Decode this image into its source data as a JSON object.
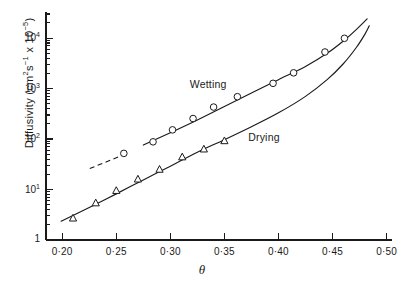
{
  "chart_data": {
    "type": "line",
    "title": "",
    "xlabel": "θ",
    "ylabel_html": "Diffusivity (cm<sup>2</sup>s<sup>−1</sup> x 10<sup>−5</sup>)",
    "ylabel_plain": "Diffusivity (cm2s-1 x 10-5)",
    "xlim": [
      0.185,
      0.505
    ],
    "ylim": [
      1,
      30000
    ],
    "yscale": "log",
    "xscale": "linear",
    "grid": false,
    "legend": "inline-annotations",
    "xticks": [
      0.2,
      0.25,
      0.3,
      0.35,
      0.4,
      0.45,
      0.5
    ],
    "xticklabels": [
      "0·20",
      "0·25",
      "0·30",
      "0·35",
      "0·40",
      "0·45",
      "0·50"
    ],
    "yticks": [
      1,
      10,
      100,
      1000,
      10000
    ],
    "yticklabels": [
      "1",
      "10",
      "10",
      "10",
      "10"
    ],
    "yticklabels_exp": [
      "",
      "1",
      "2",
      "3",
      "4"
    ],
    "series": [
      {
        "name": "Wetting",
        "marker": "open-circle",
        "line": "solid-with-dashed-extension",
        "label_x": 0.318,
        "label_y": 1150,
        "points": [
          {
            "x": 0.257,
            "y": 52
          },
          {
            "x": 0.284,
            "y": 88
          },
          {
            "x": 0.302,
            "y": 152
          },
          {
            "x": 0.321,
            "y": 255
          },
          {
            "x": 0.34,
            "y": 430
          },
          {
            "x": 0.362,
            "y": 690
          },
          {
            "x": 0.395,
            "y": 1270
          },
          {
            "x": 0.414,
            "y": 2050
          },
          {
            "x": 0.443,
            "y": 5300
          },
          {
            "x": 0.461,
            "y": 9900
          }
        ],
        "fit_curve": [
          {
            "x": 0.2255,
            "y": 26
          },
          {
            "x": 0.25,
            "y": 44
          },
          {
            "x": 0.275,
            "y": 76
          },
          {
            "x": 0.3,
            "y": 133
          },
          {
            "x": 0.325,
            "y": 238
          },
          {
            "x": 0.35,
            "y": 440
          },
          {
            "x": 0.375,
            "y": 820
          },
          {
            "x": 0.4,
            "y": 1500
          },
          {
            "x": 0.425,
            "y": 2750
          },
          {
            "x": 0.445,
            "y": 5000
          },
          {
            "x": 0.462,
            "y": 9500
          },
          {
            "x": 0.475,
            "y": 17000
          },
          {
            "x": 0.482,
            "y": 24000
          }
        ],
        "dashed_segment": [
          {
            "x": 0.2255,
            "y": 26
          },
          {
            "x": 0.258,
            "y": 50
          }
        ]
      },
      {
        "name": "Drying",
        "marker": "open-triangle",
        "line": "solid",
        "label_x": 0.372,
        "label_y": 105,
        "points": [
          {
            "x": 0.21,
            "y": 2.7
          },
          {
            "x": 0.231,
            "y": 5.4
          },
          {
            "x": 0.25,
            "y": 9.5
          },
          {
            "x": 0.27,
            "y": 16
          },
          {
            "x": 0.29,
            "y": 25
          },
          {
            "x": 0.311,
            "y": 44
          },
          {
            "x": 0.331,
            "y": 63
          },
          {
            "x": 0.35,
            "y": 92
          }
        ],
        "fit_curve": [
          {
            "x": 0.199,
            "y": 2.35
          },
          {
            "x": 0.225,
            "y": 4.4
          },
          {
            "x": 0.25,
            "y": 8.2
          },
          {
            "x": 0.275,
            "y": 15.5
          },
          {
            "x": 0.3,
            "y": 29
          },
          {
            "x": 0.325,
            "y": 55
          },
          {
            "x": 0.35,
            "y": 97
          },
          {
            "x": 0.375,
            "y": 175
          },
          {
            "x": 0.4,
            "y": 330
          },
          {
            "x": 0.425,
            "y": 700
          },
          {
            "x": 0.445,
            "y": 1500
          },
          {
            "x": 0.46,
            "y": 3100
          },
          {
            "x": 0.472,
            "y": 6500
          },
          {
            "x": 0.48,
            "y": 12000
          },
          {
            "x": 0.484,
            "y": 17500
          }
        ]
      }
    ]
  },
  "axis": {
    "y_tick_base": "10",
    "y_one_label": "1"
  }
}
